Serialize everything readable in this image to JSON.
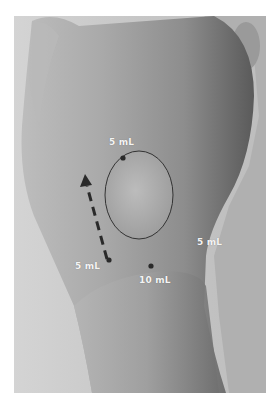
{
  "figure": {
    "lesion_outline": "ellipse",
    "annotations": [
      {
        "id": "top",
        "label": "5 mL"
      },
      {
        "id": "left",
        "label": "5 mL"
      },
      {
        "id": "bottom",
        "label": "10 mL"
      },
      {
        "id": "right",
        "label": "5 mL"
      }
    ],
    "arrow": {
      "style": "dashed",
      "direction": "up-left"
    },
    "colors": {
      "background": "#ffffff",
      "label_text": "#f4f4f4",
      "markers": "#2a2a2a",
      "outline": "#333333"
    }
  }
}
